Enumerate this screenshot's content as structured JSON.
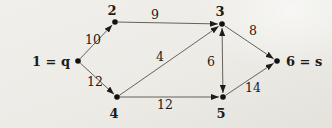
{
  "figure": {
    "type": "directed-weighted-graph",
    "background_color": "#ecebe6",
    "line_color": "#55524c",
    "arrow_color": "#1d1c1a",
    "node_color": "#111110",
    "text_color": "#1c1b19",
    "node_dot_radius": 2.8,
    "nodes": [
      {
        "id": "1",
        "label": "1 = q",
        "x": 78,
        "y": 61,
        "label_x": 70,
        "label_y": 66,
        "anchor": "end"
      },
      {
        "id": "2",
        "label": "2",
        "x": 115,
        "y": 22,
        "label_x": 112,
        "label_y": 15,
        "anchor": "middle"
      },
      {
        "id": "3",
        "label": "3",
        "x": 222,
        "y": 24,
        "label_x": 220,
        "label_y": 16,
        "anchor": "middle"
      },
      {
        "id": "4",
        "label": "4",
        "x": 117,
        "y": 97,
        "label_x": 114,
        "label_y": 118,
        "anchor": "middle"
      },
      {
        "id": "5",
        "label": "5",
        "x": 223,
        "y": 97,
        "label_x": 221,
        "label_y": 118,
        "anchor": "middle"
      },
      {
        "id": "6",
        "label": "6 = s",
        "x": 277,
        "y": 61,
        "label_x": 286,
        "label_y": 66,
        "anchor": "start"
      }
    ],
    "edges": [
      {
        "from": "1",
        "to": "2",
        "weight": "10",
        "label_x": 93,
        "label_y": 44,
        "bidirectional": false
      },
      {
        "from": "1",
        "to": "4",
        "weight": "12",
        "label_x": 95,
        "label_y": 86,
        "bidirectional": false
      },
      {
        "from": "2",
        "to": "3",
        "weight": "9",
        "label_x": 155,
        "label_y": 19,
        "bidirectional": false
      },
      {
        "from": "4",
        "to": "3",
        "weight": "4",
        "label_x": 160,
        "label_y": 61,
        "bidirectional": false
      },
      {
        "from": "4",
        "to": "5",
        "weight": "12",
        "label_x": 165,
        "label_y": 109,
        "bidirectional": false
      },
      {
        "from": "3",
        "to": "5",
        "weight": "6",
        "label_x": 211,
        "label_y": 66,
        "bidirectional": true
      },
      {
        "from": "3",
        "to": "6",
        "weight": "8",
        "label_x": 253,
        "label_y": 35,
        "bidirectional": false
      },
      {
        "from": "5",
        "to": "6",
        "weight": "14",
        "label_x": 253,
        "label_y": 92,
        "bidirectional": false
      }
    ]
  }
}
